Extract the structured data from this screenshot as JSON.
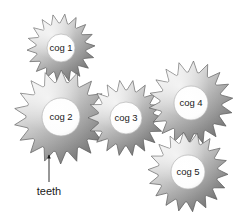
{
  "figure": {
    "type": "gear-train-diagram",
    "background_color": "#ffffff",
    "label_text_color": "#1a1a1a",
    "gear_light_color": "#f2f2f2",
    "gear_mid_color": "#b8b8b8",
    "gear_dark_color": "#6f6f6f",
    "gear_outline_color": "#555555",
    "hub_fill_color": "#ffffff"
  },
  "cogs": [
    {
      "id": "cog-1",
      "label": "cog 1",
      "cx": 61,
      "cy": 48,
      "outer_radius": 34,
      "root_radius": 25,
      "hub_radius": 14,
      "teeth": 18,
      "rotation": 8
    },
    {
      "id": "cog-2",
      "label": "cog 2",
      "cx": 61,
      "cy": 117,
      "outer_radius": 47,
      "root_radius": 35,
      "hub_radius": 19,
      "teeth": 18,
      "rotation": 2
    },
    {
      "id": "cog-3",
      "label": "cog 3",
      "cx": 126,
      "cy": 118,
      "outer_radius": 38,
      "root_radius": 28,
      "hub_radius": 16,
      "teeth": 18,
      "rotation": 12
    },
    {
      "id": "cog-4",
      "label": "cog 4",
      "cx": 191,
      "cy": 103,
      "outer_radius": 42,
      "root_radius": 31,
      "hub_radius": 17,
      "teeth": 18,
      "rotation": 5
    },
    {
      "id": "cog-5",
      "label": "cog 5",
      "cx": 188,
      "cy": 172,
      "outer_radius": 40,
      "root_radius": 30,
      "hub_radius": 17,
      "teeth": 18,
      "rotation": 15
    }
  ],
  "callout": {
    "label": "teeth",
    "label_x": 49,
    "label_y": 192,
    "arrow_tail_x": 49,
    "arrow_tail_y": 182,
    "arrow_head_x": 49,
    "arrow_head_y": 155,
    "line_color": "#1a1a1a"
  }
}
